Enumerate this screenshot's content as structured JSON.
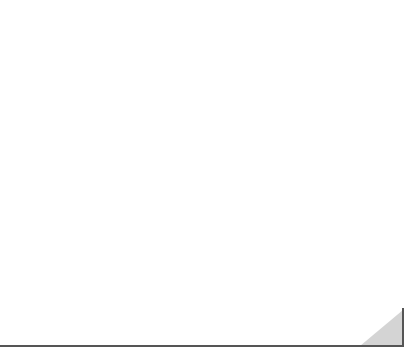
{
  "chart_data": {
    "type": "coordinate-grid",
    "title": "",
    "xlabel": "x",
    "ylabel": "y",
    "xlim": [
      -6,
      6
    ],
    "ylim": [
      -2,
      8
    ],
    "grid": true,
    "x_tick_label": "1",
    "y_tick_label": "1",
    "series": []
  },
  "labels": {
    "x_axis": "x",
    "y_axis": "y",
    "x_unit": "1",
    "y_unit": "1"
  },
  "colors": {
    "grid": "#8a8a8a",
    "axis": "#1a1a1a",
    "corner_fill": "#d4d4d4",
    "frame": "#555555"
  }
}
